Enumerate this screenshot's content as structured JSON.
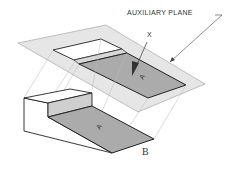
{
  "diagram": {
    "labels": {
      "auxiliary_plane": "AUXILIARY PLANE",
      "view_direction": "X",
      "surface_true_size": "A",
      "surface_object": "A",
      "figure_caption": "B"
    },
    "colors": {
      "plane_fill": "#e4e4e4",
      "surface_fill": "#a9a9a9",
      "side_fill": "#c9c9c9",
      "line": "#333333",
      "projector": "#b0b0b0"
    }
  }
}
